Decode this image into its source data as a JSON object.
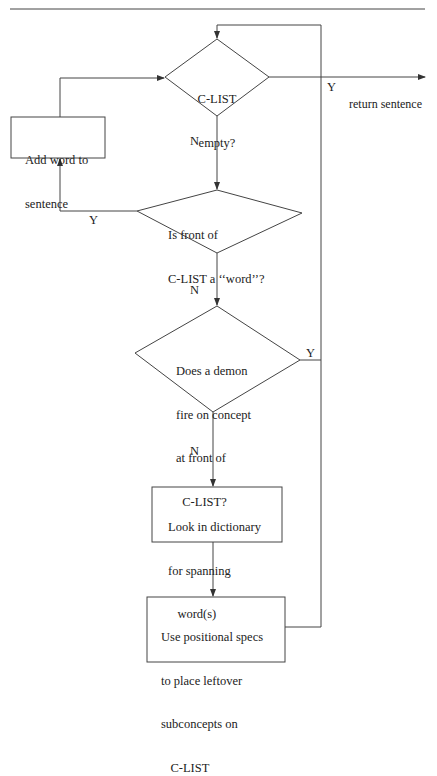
{
  "diagram": {
    "type": "flowchart",
    "nodes": {
      "d1": {
        "shape": "diamond",
        "lines": [
          "C-LIST",
          "empty?"
        ]
      },
      "add": {
        "shape": "box",
        "lines": [
          "Add word to",
          "sentence"
        ]
      },
      "d2": {
        "shape": "diamond",
        "lines": [
          "Is front of",
          "C-LIST a ‘‘word’’?"
        ]
      },
      "d3": {
        "shape": "diamond",
        "lines": [
          "Does a demon",
          "fire on concept",
          "at front of",
          "  C-LIST?"
        ]
      },
      "dict": {
        "shape": "box",
        "lines": [
          "Look in dictionary",
          "for spanning",
          "   word(s)"
        ]
      },
      "pos": {
        "shape": "box",
        "lines": [
          "Use positional specs",
          "to place leftover",
          "subconcepts on",
          "   C-LIST"
        ]
      }
    },
    "edge_labels": {
      "d1_yes": "Y",
      "d1_no": "N",
      "d2_yes": "Y",
      "d2_no": "N",
      "d3_yes": "Y",
      "d3_no": "N",
      "exit": "return sentence"
    },
    "edges": [
      {
        "from": "d1",
        "to": "exit",
        "label": "Y"
      },
      {
        "from": "d1",
        "to": "d2",
        "label": "N"
      },
      {
        "from": "d2",
        "to": "add",
        "label": "Y"
      },
      {
        "from": "add",
        "to": "d1"
      },
      {
        "from": "d2",
        "to": "d3",
        "label": "N"
      },
      {
        "from": "d3",
        "to": "d1",
        "label": "Y"
      },
      {
        "from": "d3",
        "to": "dict",
        "label": "N"
      },
      {
        "from": "dict",
        "to": "pos"
      },
      {
        "from": "pos",
        "to": "d1"
      }
    ]
  }
}
